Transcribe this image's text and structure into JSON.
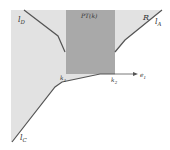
{
  "diagram": {
    "type": "polyhedral-region",
    "colors": {
      "background": "#ffffff",
      "region_fill": "#e2e2e2",
      "pt_fill": "#a9a9a9",
      "line": "#555555"
    },
    "labels": {
      "lD": "l",
      "lD_sub": "D",
      "pt": "PT(k)",
      "R": "R",
      "lA": "l",
      "lA_sub": "A",
      "k1": "k",
      "k1_sub": "1",
      "k2": "k",
      "k2_sub": "2",
      "e1": "e",
      "e1_sub": "1",
      "lC": "l",
      "lC_sub": "C"
    }
  }
}
